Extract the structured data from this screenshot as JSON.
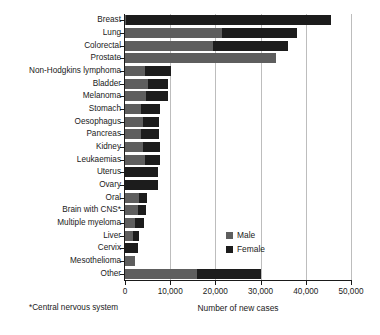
{
  "chart_data": {
    "type": "bar",
    "orientation": "horizontal",
    "stacked": true,
    "title": "",
    "xlabel": "Number of new cases",
    "ylabel": "",
    "xlim": [
      0,
      50000
    ],
    "xticks": [
      0,
      10000,
      20000,
      30000,
      40000,
      50000
    ],
    "xticklabels": [
      "0",
      "10,000",
      "20,000",
      "30,000",
      "40,000",
      "50,000"
    ],
    "grid": "vertical",
    "legend_position": "center-right",
    "categories": [
      "Breast",
      "Lung",
      "Colorectal",
      "Prostate",
      "Non-Hodgkins lymphoma",
      "Bladder",
      "Melanoma",
      "Stomach",
      "Oesophagus",
      "Pancreas",
      "Kidney",
      "Leukaemias",
      "Uterus",
      "Ovary",
      "Oral",
      "Brain with CNS*",
      "Multiple myeloma",
      "Liver",
      "Cervix",
      "Mesothelioma",
      "Other"
    ],
    "series": [
      {
        "name": "Male",
        "color": "#5e5e5e",
        "values": [
          300,
          21500,
          19500,
          33500,
          4500,
          5100,
          4600,
          3600,
          3900,
          3500,
          4000,
          4400,
          0,
          0,
          3200,
          2900,
          2300,
          1800,
          0,
          2200,
          16000
        ]
      },
      {
        "name": "Female",
        "color": "#1c1c1c",
        "values": [
          45300,
          16500,
          16500,
          0,
          5700,
          4400,
          5000,
          4100,
          3700,
          4100,
          3700,
          3400,
          7300,
          7300,
          1700,
          1800,
          1800,
          1200,
          2800,
          0,
          14000
        ]
      }
    ],
    "totals": [
      45600,
      38000,
      36000,
      33500,
      10200,
      9500,
      9600,
      7700,
      7600,
      7600,
      7700,
      7800,
      7300,
      7300,
      4900,
      4700,
      4100,
      3000,
      2800,
      2200,
      30000
    ],
    "footnote": "*Central nervous system"
  },
  "legend": {
    "items": [
      {
        "label": "Male",
        "color": "#5e5e5e"
      },
      {
        "label": "Female",
        "color": "#1c1c1c"
      }
    ]
  }
}
